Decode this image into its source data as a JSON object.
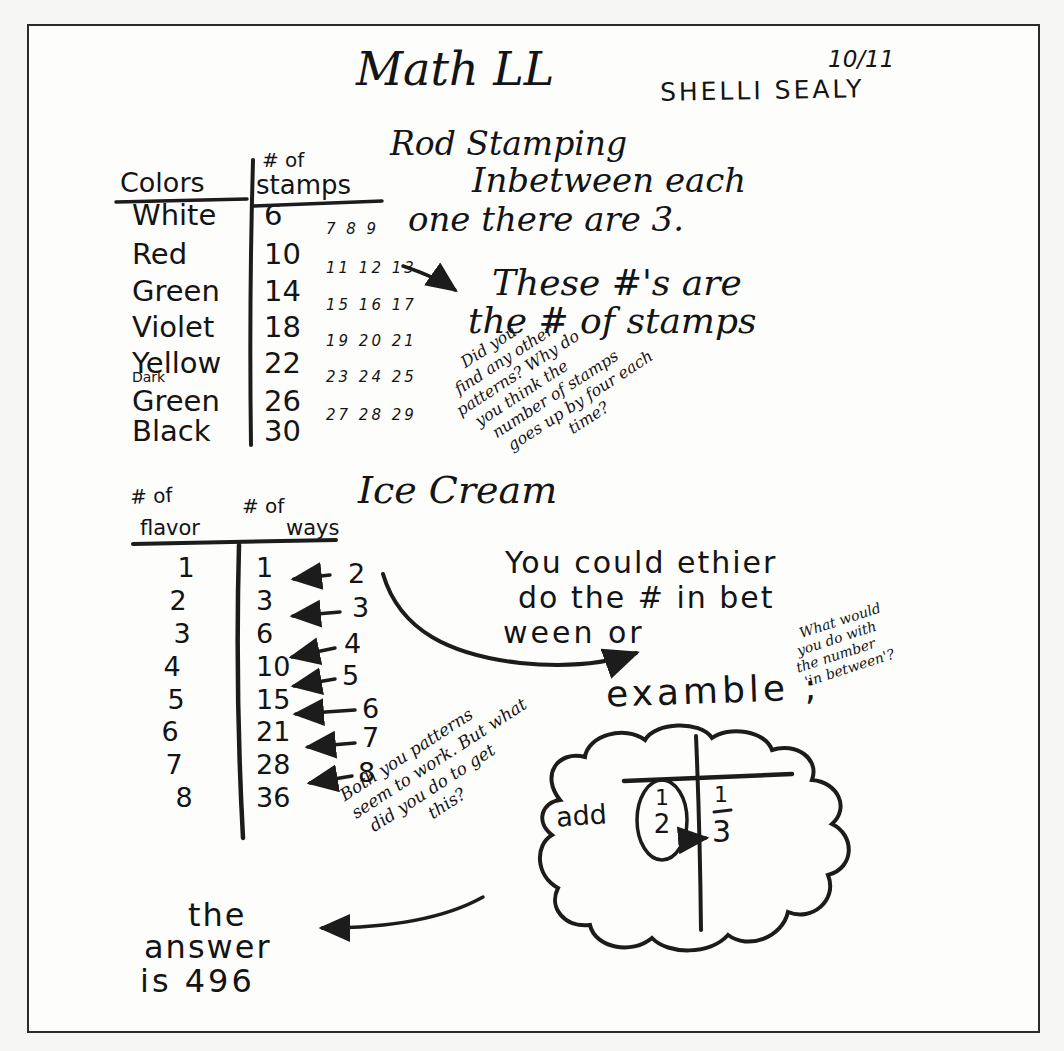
{
  "page": {
    "title": "Math LL",
    "date": "10/11",
    "student": "SHELLI SEALY"
  },
  "rod_stamping": {
    "heading": "Rod Stamping",
    "note_line1": "Inbetween each",
    "note_line2": "one there are 3.",
    "table": {
      "col1_header": "Colors",
      "col2_header_top": "# of",
      "col2_header_bottom": "stamps",
      "rows": [
        {
          "color": "White",
          "stamps": "6",
          "between": "7 8 9"
        },
        {
          "color": "Red",
          "stamps": "10",
          "between": "11 12 13"
        },
        {
          "color": "Green",
          "stamps": "14",
          "between": "15 16 17"
        },
        {
          "color": "Violet",
          "stamps": "18",
          "between": "19 20 21"
        },
        {
          "color": "Yellow",
          "stamps": "22",
          "between": "23 24 25"
        },
        {
          "color_prefix": "Dark",
          "color": "Green",
          "stamps": "26",
          "between": "27 28 29"
        },
        {
          "color": "Black",
          "stamps": "30",
          "between": ""
        }
      ]
    },
    "annotation_line1": "These #'s are",
    "annotation_line2": "the # of stamps",
    "teacher_note": {
      "lines": [
        "Did you",
        "find any other",
        "patterns? Why do",
        "you think the",
        "number of stamps",
        "goes up by four each",
        "time?"
      ]
    }
  },
  "ice_cream": {
    "heading": "Ice Cream",
    "table": {
      "col1_header_top": "# of",
      "col1_header_bottom": "flavor",
      "col2_header_top": "# of",
      "col2_header_bottom": "ways",
      "rows": [
        {
          "flavors": "1",
          "ways": "1"
        },
        {
          "flavors": "2",
          "ways": "3"
        },
        {
          "flavors": "3",
          "ways": "6"
        },
        {
          "flavors": "4",
          "ways": "10"
        },
        {
          "flavors": "5",
          "ways": "15"
        },
        {
          "flavors": "6",
          "ways": "21"
        },
        {
          "flavors": "7",
          "ways": "28"
        },
        {
          "flavors": "8",
          "ways": "36"
        }
      ],
      "differences": [
        "2",
        "3",
        "4",
        "5",
        "6",
        "7",
        "8"
      ]
    },
    "student_note_line1": "You could ethier",
    "student_note_line2": "do the # in bet",
    "student_note_line3": "ween or",
    "teacher_note2": {
      "lines": [
        "What would",
        "you do with",
        "the number",
        "'in between'?"
      ]
    },
    "example_label": "examble ;",
    "cloud": {
      "add_label": "add",
      "fraction_top": "1",
      "fraction_bottom": "2",
      "result_top": "1",
      "result": "3"
    },
    "teacher_note3": {
      "lines": [
        "Both you patterns",
        "seem to work. But what",
        "did you do to get",
        "this?"
      ]
    },
    "answer_line1": "the",
    "answer_line2": "answer",
    "answer_line3": "is 496"
  },
  "ink_color": "#1c1c1c"
}
